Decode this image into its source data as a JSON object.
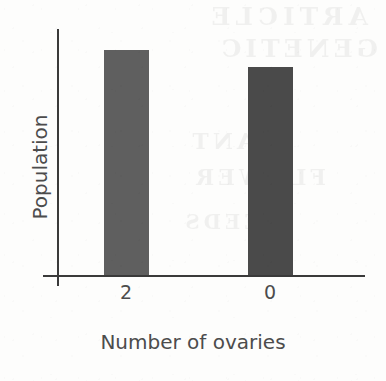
{
  "figure": {
    "background_color": "#fdfdfc",
    "axis_color": "#3a3a3a",
    "text_color": "#4c4c4c"
  },
  "bleed_through": {
    "note": "faint mirrored show-through text from the reverse side of the scanned page",
    "lines": [
      "ARTICLE",
      "GENETIC",
      "PLANT",
      "FLOWER",
      "SEEDS"
    ]
  },
  "chart_data": {
    "type": "bar",
    "title": "",
    "subtitle": "",
    "xlabel": "Number of ovaries",
    "ylabel": "Population",
    "categories": [
      "2",
      "0"
    ],
    "values": [
      225,
      208
    ],
    "value_unit": "relative bar height (px); no numeric y-axis scale is printed",
    "ylim": [
      0,
      247
    ],
    "grid": false,
    "legend": null,
    "y_tick_labels": [],
    "x_tick_labels": [
      "2",
      "0"
    ],
    "series": [
      {
        "name": "Population",
        "values": [
          225,
          208
        ],
        "colors": [
          "#5f5f5f",
          "#4a4a4a"
        ]
      }
    ],
    "annotations": []
  }
}
